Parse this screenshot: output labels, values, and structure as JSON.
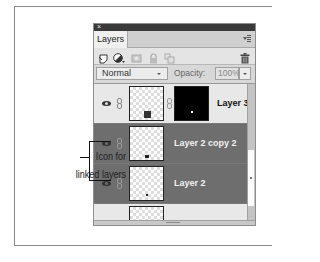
{
  "panel": {
    "close_glyph": "×",
    "tab_label": "Layers",
    "menu_icon": "panel-menu-icon",
    "toolbar": {
      "tools": [
        {
          "name": "new-layer-icon"
        },
        {
          "name": "adjustment-layer-icon"
        },
        {
          "name": "layer-mask-icon"
        },
        {
          "name": "lock-icon"
        },
        {
          "name": "lock-transparency-icon"
        },
        {
          "name": "trash-icon"
        }
      ]
    },
    "blend_mode": "Normal",
    "opacity_label": "Opacity:",
    "opacity_value": "100%"
  },
  "layers": [
    {
      "name": "Layer 3",
      "selected": false,
      "has_mask": true
    },
    {
      "name": "Layer 2 copy 2",
      "selected": true,
      "has_mask": false
    },
    {
      "name": "Layer 2",
      "selected": true,
      "has_mask": false
    },
    {
      "name": "",
      "selected": false,
      "has_mask": false
    }
  ],
  "callout": {
    "line1": "Icon for",
    "line2": "linked layers"
  },
  "colors": {
    "selected_row": "#6e6e6e",
    "normal_row": "#e8e8e8",
    "titlebar": "#3a3a3a"
  }
}
